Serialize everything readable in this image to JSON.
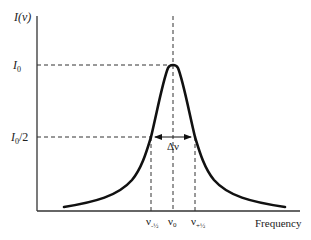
{
  "diagram": {
    "y_axis_label": "I(ν)",
    "x_axis_label": "Frequency",
    "y_ticks": [
      {
        "label_main": "I",
        "label_sub": "0",
        "label_suffix": "",
        "meaning": "peak intensity"
      },
      {
        "label_main": "I",
        "label_sub": "0",
        "label_suffix": "/2",
        "meaning": "half maximum"
      }
    ],
    "x_ticks": [
      {
        "label_main": "ν",
        "label_sub": "-½",
        "meaning": "lower half-max frequency"
      },
      {
        "label_main": "ν",
        "label_sub": "0",
        "meaning": "line center"
      },
      {
        "label_main": "ν",
        "label_sub": "+½",
        "meaning": "upper half-max frequency"
      }
    ],
    "width_label": "Δν",
    "colors": {
      "curve": "#111111",
      "axes": "#333333",
      "dashed": "#333333"
    }
  }
}
